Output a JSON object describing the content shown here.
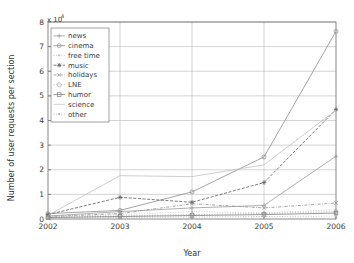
{
  "figure": {
    "background": "#ffffff",
    "plot_border_color": "#6b6b6b",
    "grid_color": "#b9b9b9"
  },
  "chart_data": {
    "type": "line",
    "title": "",
    "subtitle": "",
    "xlabel": "Year",
    "ylabel": "Number of user requests per section",
    "y_exponent_label": "x 10",
    "y_exponent_power": "4",
    "x": [
      "2002",
      "2003",
      "2004",
      "2005",
      "2006"
    ],
    "categories": [
      "2002",
      "2003",
      "2004",
      "2005",
      "2006"
    ],
    "xlim": [
      2002,
      2006
    ],
    "ylim": [
      0,
      8
    ],
    "y_ticks": [
      "0",
      "1",
      "2",
      "3",
      "4",
      "5",
      "6",
      "7",
      "8"
    ],
    "x_ticks": [
      "2002",
      "2003",
      "2004",
      "2005",
      "2006"
    ],
    "grid": true,
    "legend_position": "upper left",
    "y_scale_note": "values are in units of 10^4",
    "series": [
      {
        "name": "news",
        "marker": "plus-marker",
        "linestyle": "solid",
        "color": "#9a9a9a",
        "values": [
          0.12,
          0.3,
          0.45,
          0.55,
          2.55
        ]
      },
      {
        "name": "cinema",
        "marker": "circle-marker",
        "linestyle": "solid",
        "color": "#8c8c8c",
        "values": [
          0.22,
          0.35,
          1.1,
          2.52,
          7.62
        ]
      },
      {
        "name": "free time",
        "marker": "dot-marker",
        "linestyle": "dotted",
        "color": "#bdbdbd",
        "values": [
          0.08,
          0.18,
          0.3,
          0.25,
          0.38
        ]
      },
      {
        "name": "music",
        "marker": "star-marker",
        "linestyle": "dashed",
        "color": "#5c5c5c",
        "values": [
          0.18,
          0.88,
          0.68,
          1.48,
          4.45
        ]
      },
      {
        "name": "holidays",
        "marker": "x-marker",
        "linestyle": "dash-dot",
        "color": "#8f8f8f",
        "values": [
          0.1,
          0.22,
          0.62,
          0.45,
          0.65
        ]
      },
      {
        "name": "LNE",
        "marker": "circle-open-marker",
        "linestyle": "dotted",
        "color": "#a8a8a8",
        "values": [
          0.05,
          0.12,
          0.18,
          0.22,
          0.3
        ]
      },
      {
        "name": "humor",
        "marker": "square-marker",
        "linestyle": "solid",
        "color": "#7d7d7d",
        "values": [
          0.06,
          0.1,
          0.14,
          0.18,
          0.24
        ]
      },
      {
        "name": "science",
        "marker": "none",
        "linestyle": "solid",
        "color": "#c2c2c2",
        "values": [
          0.15,
          1.76,
          1.72,
          2.2,
          4.42
        ]
      },
      {
        "name": "other",
        "marker": "dot-marker",
        "linestyle": "dotted",
        "color": "#b0b0b0",
        "values": [
          0.03,
          0.06,
          0.08,
          0.1,
          0.12
        ]
      }
    ]
  }
}
